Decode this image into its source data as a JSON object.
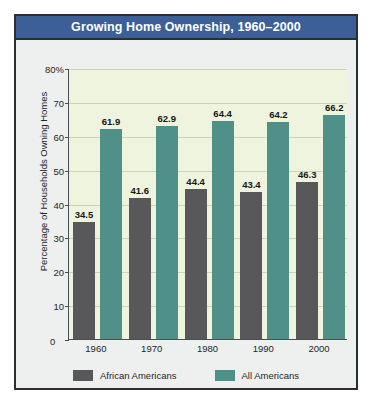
{
  "card": {
    "title": "Growing Home Ownership, 1960–2000"
  },
  "legend": {
    "items": [
      {
        "label": "African Americans",
        "color": "#58585a"
      },
      {
        "label": "All Americans",
        "color": "#4f9189"
      }
    ]
  },
  "axis": {
    "y_title": "Percentage of Households Owning Homes",
    "zero_label": "0"
  },
  "chart_data": {
    "type": "bar",
    "title": "Growing Home Ownership, 1960–2000",
    "xlabel": "",
    "ylabel": "Percentage of Households Owning Homes",
    "ylim": [
      0,
      80
    ],
    "yticks": [
      0,
      10,
      20,
      30,
      40,
      50,
      60,
      70,
      80
    ],
    "ytick_labels": [
      "0",
      "10",
      "20",
      "30",
      "40",
      "50",
      "60",
      "70",
      "80%"
    ],
    "grid": true,
    "legend_position": "bottom",
    "categories": [
      "1960",
      "1970",
      "1980",
      "1990",
      "2000"
    ],
    "series": [
      {
        "name": "African Americans",
        "color": "#58585a",
        "values": [
          34.5,
          41.6,
          44.4,
          43.4,
          46.3
        ]
      },
      {
        "name": "All Americans",
        "color": "#4f9189",
        "values": [
          61.9,
          62.9,
          64.4,
          64.2,
          66.2
        ]
      }
    ]
  }
}
